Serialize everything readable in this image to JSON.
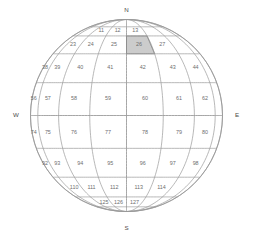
{
  "figure": {
    "name": "spherical-grid-globe",
    "background_color": "#ffffff",
    "outline_color": "#8a8a8a",
    "grid_color": "#9a9a9a",
    "label_color": "#6e6e6e",
    "highlight_color": "#cccccc",
    "highlight_cell": "26"
  },
  "cardinals": {
    "north": "N",
    "south": "S",
    "east": "E",
    "west": "W"
  },
  "geometry": {
    "center_x": 126.5,
    "center_y": 115.5,
    "radius": 96,
    "lat_bands": [
      90,
      67.5,
      45,
      22.5,
      0,
      -22.5,
      -45,
      -67.5,
      -90
    ],
    "lon_step": 22.5,
    "lon_min": -90,
    "lon_max": 90
  },
  "rows": [
    {
      "row_index": 0,
      "lat_top": 90,
      "lat_bottom": 67.5,
      "cells": []
    },
    {
      "row_index": 1,
      "lat_top": 67.5,
      "lat_bottom": 56,
      "cells": [
        {
          "label": "11",
          "lon_center": -33.75
        },
        {
          "label": "12",
          "lon_center": -11.25
        },
        {
          "label": "13",
          "lon_center": 11.25
        }
      ]
    },
    {
      "row_index": 2,
      "lat_top": 56,
      "lat_bottom": 40,
      "cells": [
        {
          "label": "23",
          "lon_center": -56.25
        },
        {
          "label": "24",
          "lon_center": -33.75
        },
        {
          "label": "25",
          "lon_center": -11.25
        },
        {
          "label": "26",
          "lon_center": 11.25
        },
        {
          "label": "27",
          "lon_center": 33.75
        }
      ]
    },
    {
      "row_index": 3,
      "lat_top": 40,
      "lat_bottom": 20,
      "cells": [
        {
          "label": "38",
          "lon_center": -78.75
        },
        {
          "label": "39",
          "lon_center": -56.25
        },
        {
          "label": "40",
          "lon_center": -33.75
        },
        {
          "label": "41",
          "lon_center": -11.25
        },
        {
          "label": "42",
          "lon_center": 11.25
        },
        {
          "label": "43",
          "lon_center": 33.75
        },
        {
          "label": "44",
          "lon_center": 56.25
        }
      ]
    },
    {
      "row_index": 4,
      "lat_top": 20,
      "lat_bottom": 0,
      "cells": [
        {
          "label": "56",
          "lon_center": -78.75
        },
        {
          "label": "57",
          "lon_center": -56.25
        },
        {
          "label": "58",
          "lon_center": -33.75
        },
        {
          "label": "59",
          "lon_center": -11.25
        },
        {
          "label": "60",
          "lon_center": 11.25
        },
        {
          "label": "61",
          "lon_center": 33.75
        },
        {
          "label": "62",
          "lon_center": 56.25
        }
      ]
    },
    {
      "row_index": 5,
      "lat_top": 0,
      "lat_bottom": -20,
      "cells": [
        {
          "label": "74",
          "lon_center": -78.75
        },
        {
          "label": "75",
          "lon_center": -56.25
        },
        {
          "label": "76",
          "lon_center": -33.75
        },
        {
          "label": "77",
          "lon_center": -11.25
        },
        {
          "label": "78",
          "lon_center": 11.25
        },
        {
          "label": "79",
          "lon_center": 33.75
        },
        {
          "label": "80",
          "lon_center": 56.25
        }
      ]
    },
    {
      "row_index": 6,
      "lat_top": -20,
      "lat_bottom": -40,
      "cells": [
        {
          "label": "92",
          "lon_center": -78.75
        },
        {
          "label": "93",
          "lon_center": -56.25
        },
        {
          "label": "94",
          "lon_center": -33.75
        },
        {
          "label": "95",
          "lon_center": -11.25
        },
        {
          "label": "96",
          "lon_center": 11.25
        },
        {
          "label": "97",
          "lon_center": 33.75
        },
        {
          "label": "98",
          "lon_center": 56.25
        }
      ]
    },
    {
      "row_index": 7,
      "lat_top": -40,
      "lat_bottom": -58,
      "cells": [
        {
          "label": "110",
          "lon_center": -56.25
        },
        {
          "label": "111",
          "lon_center": -33.75
        },
        {
          "label": "112",
          "lon_center": -11.25
        },
        {
          "label": "113",
          "lon_center": 11.25
        },
        {
          "label": "114",
          "lon_center": 33.75
        }
      ]
    },
    {
      "row_index": 8,
      "lat_top": -58,
      "lat_bottom": -72,
      "cells": [
        {
          "label": "125",
          "lon_center": -33.75
        },
        {
          "label": "126",
          "lon_center": -11.25
        },
        {
          "label": "127",
          "lon_center": 11.25
        }
      ]
    }
  ]
}
